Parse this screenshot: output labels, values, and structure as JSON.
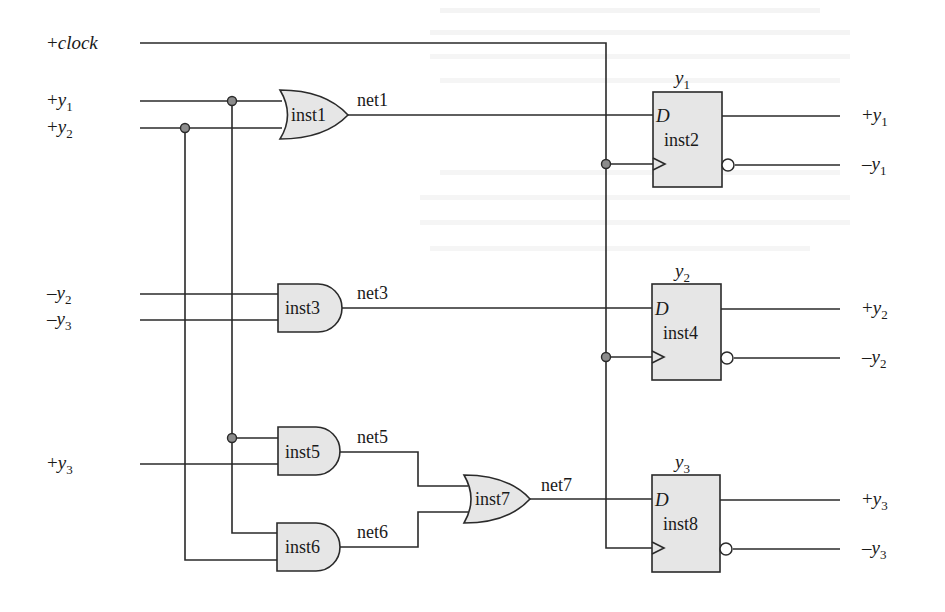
{
  "diagram": {
    "type": "sequential logic circuit",
    "colors": {
      "gate_fill": "#e6e6e6",
      "wire": "#2a2a2a",
      "junction": "#8c8c8c"
    },
    "inputs": [
      {
        "id": "clock",
        "sign": "+",
        "var": "clock",
        "sub": ""
      },
      {
        "id": "py1",
        "sign": "+",
        "var": "y",
        "sub": "1"
      },
      {
        "id": "py2",
        "sign": "+",
        "var": "y",
        "sub": "2"
      },
      {
        "id": "ny2",
        "sign": "–",
        "var": "y",
        "sub": "2"
      },
      {
        "id": "ny3",
        "sign": "–",
        "var": "y",
        "sub": "3"
      },
      {
        "id": "py3",
        "sign": "+",
        "var": "y",
        "sub": "3"
      }
    ],
    "gates": [
      {
        "id": "inst1",
        "label": "inst1",
        "type": "OR",
        "inputs": [
          "+y1",
          "+y2"
        ],
        "output": "net1"
      },
      {
        "id": "inst3",
        "label": "inst3",
        "type": "AND",
        "inputs": [
          "-y2",
          "-y3"
        ],
        "output": "net3"
      },
      {
        "id": "inst5",
        "label": "inst5",
        "type": "AND",
        "inputs": [
          "+y1",
          "+y3"
        ],
        "output": "net5"
      },
      {
        "id": "inst6",
        "label": "inst6",
        "type": "AND",
        "inputs": [
          "+y1",
          "+y2"
        ],
        "output": "net6"
      },
      {
        "id": "inst7",
        "label": "inst7",
        "type": "OR",
        "inputs": [
          "net5",
          "net6"
        ],
        "output": "net7"
      }
    ],
    "nets": {
      "net1": "net1",
      "net3": "net3",
      "net5": "net5",
      "net6": "net6",
      "net7": "net7"
    },
    "flipflops": [
      {
        "id": "inst2",
        "label": "inst2",
        "title_var": "y",
        "title_sub": "1",
        "d_label": "D",
        "d_input": "net1",
        "q": {
          "sign": "+",
          "var": "y",
          "sub": "1"
        },
        "qn": {
          "sign": "–",
          "var": "y",
          "sub": "1"
        }
      },
      {
        "id": "inst4",
        "label": "inst4",
        "title_var": "y",
        "title_sub": "2",
        "d_label": "D",
        "d_input": "net3",
        "q": {
          "sign": "+",
          "var": "y",
          "sub": "2"
        },
        "qn": {
          "sign": "–",
          "var": "y",
          "sub": "2"
        }
      },
      {
        "id": "inst8",
        "label": "inst8",
        "title_var": "y",
        "title_sub": "3",
        "d_label": "D",
        "d_input": "net7",
        "q": {
          "sign": "+",
          "var": "y",
          "sub": "3"
        },
        "qn": {
          "sign": "–",
          "var": "y",
          "sub": "3"
        }
      }
    ]
  }
}
